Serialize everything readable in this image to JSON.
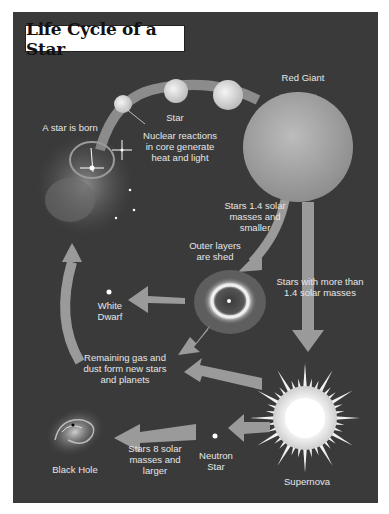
{
  "title": "Life Cycle of a Star",
  "colors": {
    "background": "#3a3a3a",
    "arrow": "#9a9a9a",
    "label": "#e6e6e6",
    "title_bg": "#ffffff"
  },
  "stages": {
    "star_born": "A star is born",
    "star": "Star",
    "nuclear": "Nuclear reactions\nin core generate\nheat and light",
    "red_giant": "Red Giant",
    "small_stars": "Stars 1.4 solar\nmasses and\nsmaller",
    "outer_layers": "Outer layers\nare shed",
    "large_stars": "Stars with more than\n1.4 solar masses",
    "white_dwarf": "White\nDwarf",
    "remaining_gas": "Remaining gas and\ndust form new stars\nand planets",
    "supernova": "Supernova",
    "neutron_star": "Neutron\nStar",
    "stars_8": "Stars 8 solar\nmasses and\nlarger",
    "black_hole": "Black Hole"
  }
}
